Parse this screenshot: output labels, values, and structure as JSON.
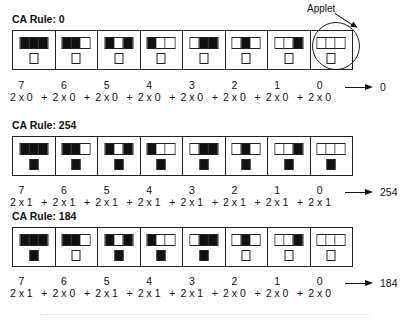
{
  "annotation": {
    "label": "Applet"
  },
  "rules": [
    {
      "title": "CA Rule: 0",
      "rule_number": "0",
      "patterns": [
        [
          1,
          1,
          1
        ],
        [
          1,
          1,
          0
        ],
        [
          1,
          0,
          1
        ],
        [
          1,
          0,
          0
        ],
        [
          0,
          1,
          1
        ],
        [
          0,
          1,
          0
        ],
        [
          0,
          0,
          1
        ],
        [
          0,
          0,
          0
        ]
      ],
      "outputs": [
        0,
        0,
        0,
        0,
        0,
        0,
        0,
        0
      ],
      "exponents": [
        "7",
        "6",
        "5",
        "4",
        "3",
        "2",
        "1",
        "0"
      ],
      "terms": [
        "2 x 0",
        "2 x 0",
        "2 x 0",
        "2 x 0",
        "2 x 0",
        "2 x 0",
        "2 x 0",
        "2 x 0"
      ],
      "plus": "+",
      "result": "0"
    },
    {
      "title": "CA Rule: 254",
      "rule_number": "254",
      "patterns": [
        [
          1,
          1,
          1
        ],
        [
          1,
          1,
          0
        ],
        [
          1,
          0,
          1
        ],
        [
          1,
          0,
          0
        ],
        [
          0,
          1,
          1
        ],
        [
          0,
          1,
          0
        ],
        [
          0,
          0,
          1
        ],
        [
          0,
          0,
          0
        ]
      ],
      "outputs": [
        1,
        1,
        1,
        1,
        1,
        1,
        1,
        1
      ],
      "exponents": [
        "7",
        "6",
        "5",
        "4",
        "3",
        "2",
        "1",
        "0"
      ],
      "terms": [
        "2 x 1",
        "2 x 1",
        "2 x 1",
        "2 x 1",
        "2 x 1",
        "2 x 1",
        "2 x 1",
        "2 x 1"
      ],
      "plus": "+",
      "result": "254"
    },
    {
      "title": "CA Rule: 184",
      "rule_number": "184",
      "patterns": [
        [
          1,
          1,
          1
        ],
        [
          1,
          1,
          0
        ],
        [
          1,
          0,
          1
        ],
        [
          1,
          0,
          0
        ],
        [
          0,
          1,
          1
        ],
        [
          0,
          1,
          0
        ],
        [
          0,
          0,
          1
        ],
        [
          0,
          0,
          0
        ]
      ],
      "outputs": [
        1,
        0,
        1,
        1,
        1,
        0,
        0,
        0
      ],
      "exponents": [
        "7",
        "6",
        "5",
        "4",
        "3",
        "2",
        "1",
        "0"
      ],
      "terms": [
        "2 x 1",
        "2 x 0",
        "2 x 1",
        "2 x 1",
        "2 x 1",
        "2 x 0",
        "2 x 0",
        "2 x 0"
      ],
      "plus": "+",
      "result": "184"
    }
  ],
  "colors": {
    "on": "#111111",
    "off": "#ffffff",
    "line": "#222222"
  }
}
